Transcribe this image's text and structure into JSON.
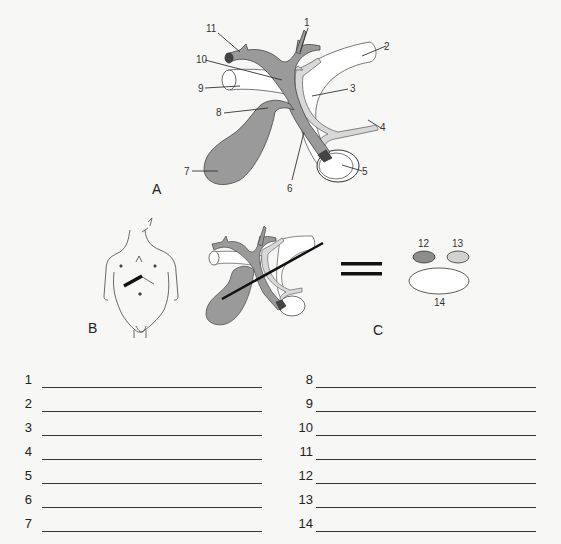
{
  "figure": {
    "panels": {
      "A": "A",
      "B": "B",
      "C": "C"
    },
    "callouts_a": [
      "1",
      "2",
      "3",
      "4",
      "5",
      "6",
      "7",
      "8",
      "9",
      "10",
      "11"
    ],
    "callouts_c": [
      "12",
      "13",
      "14"
    ],
    "colors": {
      "bile_tract": "#9a9a9a",
      "artery_pale": "#d8d8d8",
      "outline": "#333333",
      "dark_ellipse": "#8c8c8c",
      "light_ellipse": "#d2d2d2"
    }
  },
  "answers": {
    "left": [
      {
        "num": "1",
        "value": ""
      },
      {
        "num": "2",
        "value": ""
      },
      {
        "num": "3",
        "value": ""
      },
      {
        "num": "4",
        "value": ""
      },
      {
        "num": "5",
        "value": ""
      },
      {
        "num": "6",
        "value": ""
      },
      {
        "num": "7",
        "value": ""
      }
    ],
    "right": [
      {
        "num": "8",
        "value": ""
      },
      {
        "num": "9",
        "value": ""
      },
      {
        "num": "10",
        "value": ""
      },
      {
        "num": "11",
        "value": ""
      },
      {
        "num": "12",
        "value": ""
      },
      {
        "num": "13",
        "value": ""
      },
      {
        "num": "14",
        "value": ""
      }
    ]
  }
}
